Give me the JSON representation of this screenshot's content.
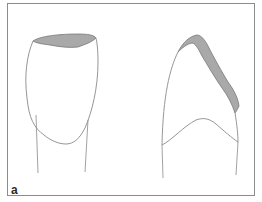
{
  "figure": {
    "panel_label": "a",
    "colors": {
      "outline": "#8a8a8a",
      "shade": "#a9a9a9",
      "frame": "#8c8c8c",
      "background": "#ffffff"
    },
    "views": [
      {
        "name": "tooth-frontal-view",
        "shaded_region": "incisal edge"
      },
      {
        "name": "tooth-lateral-view",
        "shaded_region": "lingual/incisal surface"
      }
    ]
  }
}
